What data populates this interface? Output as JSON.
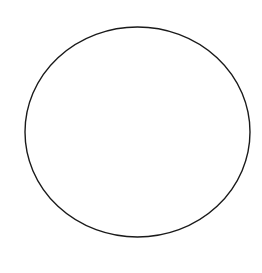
{
  "canvas": {
    "width": 262,
    "height": 273,
    "background": "#ffffff"
  },
  "shape": {
    "type": "ellipse",
    "cx": 137.5,
    "cy": 132,
    "rx": 112.5,
    "ry": 105,
    "stroke": "#1a1a1a",
    "stroke_width": 1.4,
    "fill": "none"
  }
}
